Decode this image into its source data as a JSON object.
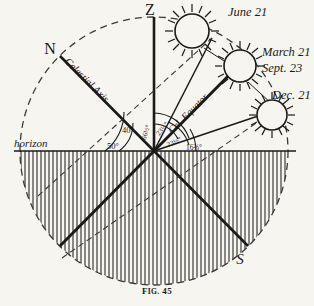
{
  "figure": {
    "caption_prefix": "F",
    "caption_rest": "IG.",
    "caption_number": "45"
  },
  "cardinal_points": {
    "zenith": "Z",
    "north": "N",
    "south": "S"
  },
  "axis_labels": {
    "celestial_axis": "Celestial Axis",
    "celestial_equator": "Cel. Equator",
    "horizon": "horizon"
  },
  "sun_labels": [
    {
      "id": "sun-june",
      "text": "June 21"
    },
    {
      "id": "sun-march-sept-line1",
      "text": "March 21"
    },
    {
      "id": "sun-march-sept-line2",
      "text": "Sept. 23"
    },
    {
      "id": "sun-december",
      "text": "Dec. 21"
    }
  ],
  "angles": [
    {
      "id": "angle-horizon-to-axis",
      "value": "50°"
    },
    {
      "id": "angle-axis-to-zenith",
      "value": "40°"
    },
    {
      "id": "angle-zenith-to-summer",
      "value": "66½°"
    },
    {
      "id": "angle-summer-to-equator",
      "value": "23½°"
    },
    {
      "id": "angle-equator-to-winter",
      "value": "23½°"
    },
    {
      "id": "angle-winter-to-horizon",
      "value": "16⅔°"
    }
  ],
  "colors": {
    "ink": "#1a1a1a",
    "paper": "#f7f5f0",
    "hatch": "#2b2b2b",
    "dashed": "#3a3a3a"
  }
}
